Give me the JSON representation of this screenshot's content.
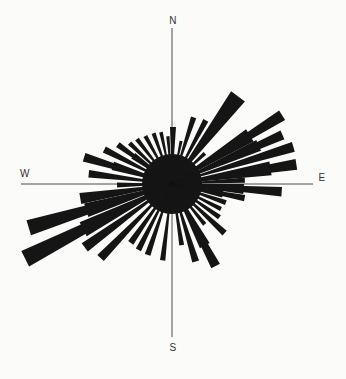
{
  "chart_data": {
    "type": "bar",
    "subtype": "polar-rose-diagram",
    "title": "",
    "xlabel": "",
    "ylabel": "",
    "grid": false,
    "legend": "none",
    "units": "bar length measured as pixel radius from center (no numeric scale shown in figure)",
    "compass_labels": {
      "n": "N",
      "e": "E",
      "s": "S",
      "w": "W"
    },
    "center_px": {
      "x": 172,
      "y": 184
    },
    "axis_lines": {
      "north_south": {
        "x": 172,
        "y1": 28,
        "y2": 337
      },
      "west_east": {
        "y": 184,
        "x1": 21,
        "x2": 313
      }
    },
    "core_radius_px": 30,
    "colors": {
      "bar": "#151515",
      "axis": "#4a4a4a",
      "label": "#333333",
      "background": "#fbfbf9"
    },
    "bars": [
      {
        "az": 1,
        "r": 57,
        "w": 6
      },
      {
        "az": 12,
        "r": 44,
        "w": 4
      },
      {
        "az": 18,
        "r": 70,
        "w": 4.5
      },
      {
        "az": 28,
        "r": 72,
        "w": 4.5
      },
      {
        "az": 37,
        "r": 110,
        "w": 9
      },
      {
        "az": 47,
        "r": 45,
        "w": 5
      },
      {
        "az": 58,
        "r": 130,
        "w": 5,
        "base": {
          "r": 92,
          "w": 9
        }
      },
      {
        "az": 66,
        "r": 121,
        "w": 4.5,
        "base": {
          "r": 95,
          "w": 7
        }
      },
      {
        "az": 73,
        "r": 127,
        "w": 4.5
      },
      {
        "az": 81,
        "r": 126,
        "w": 5,
        "base": {
          "r": 100,
          "w": 8
        }
      },
      {
        "az": 87,
        "r": 73,
        "w": 4
      },
      {
        "az": 94,
        "r": 110,
        "w": 5,
        "base": {
          "r": 72,
          "w": 8
        }
      },
      {
        "az": 101,
        "r": 74,
        "w": 5,
        "base": {
          "r": 52,
          "w": 8
        }
      },
      {
        "az": 109,
        "r": 57,
        "w": 5
      },
      {
        "az": 117,
        "r": 55,
        "w": 4.5
      },
      {
        "az": 125,
        "r": 58,
        "w": 5
      },
      {
        "az": 133,
        "r": 72,
        "w": 5
      },
      {
        "az": 141,
        "r": 52,
        "w": 4.5
      },
      {
        "az": 152,
        "r": 93,
        "w": 6,
        "base": {
          "r": 70,
          "w": 9
        }
      },
      {
        "az": 163,
        "r": 81,
        "w": 5
      },
      {
        "az": 171,
        "r": 62,
        "w": 4.5
      },
      {
        "az": 187,
        "r": 77,
        "w": 4
      },
      {
        "az": 199,
        "r": 75,
        "w": 4.5
      },
      {
        "az": 207,
        "r": 74,
        "w": 4.5
      },
      {
        "az": 215,
        "r": 72,
        "w": 5
      },
      {
        "az": 224,
        "r": 103,
        "w": 5
      },
      {
        "az": 234,
        "r": 108,
        "w": 5.5
      },
      {
        "az": 243,
        "r": 165,
        "w": 6,
        "base": {
          "r": 100,
          "w": 9
        }
      },
      {
        "az": 253,
        "r": 150,
        "w": 6,
        "base": {
          "r": 90,
          "w": 9
        }
      },
      {
        "az": 261,
        "r": 93,
        "w": 7
      },
      {
        "az": 269,
        "r": 55,
        "w": 5
      },
      {
        "az": 277,
        "r": 84,
        "w": 5
      },
      {
        "az": 287,
        "r": 92,
        "w": 5.5,
        "base": {
          "r": 62,
          "w": 8
        }
      },
      {
        "az": 297,
        "r": 76,
        "w": 5
      },
      {
        "az": 306,
        "r": 67,
        "w": 5,
        "base": {
          "r": 48,
          "w": 8
        }
      },
      {
        "az": 314,
        "r": 59,
        "w": 4.5
      },
      {
        "az": 322,
        "r": 57,
        "w": 4.5
      },
      {
        "az": 331,
        "r": 55,
        "w": 4.5
      },
      {
        "az": 340,
        "r": 54,
        "w": 4.5
      },
      {
        "az": 348,
        "r": 53,
        "w": 4
      },
      {
        "az": 355,
        "r": 48,
        "w": 4
      }
    ]
  }
}
